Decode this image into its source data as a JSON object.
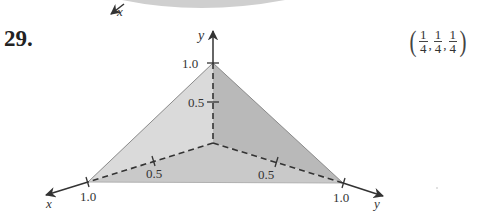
{
  "problem": {
    "number": "29.",
    "answer": {
      "open": "(",
      "close": ")",
      "fractions": [
        {
          "num": "1",
          "den": "4"
        },
        {
          "num": "1",
          "den": "4"
        },
        {
          "num": "1",
          "den": "4"
        }
      ],
      "separator": ","
    }
  },
  "figure": {
    "top_axis_label": "x",
    "axes": {
      "x": {
        "label": "x",
        "ticks": [
          "0.5",
          "1.0"
        ]
      },
      "y_vertical": {
        "label": "y",
        "ticks": [
          "0.5",
          "1.0"
        ]
      },
      "y_right": {
        "label": "y",
        "ticks": [
          "0.5",
          "1.0"
        ]
      }
    },
    "colors": {
      "face_left": "#dadada",
      "face_right": "#b9b9b9",
      "face_bottom": "#c9c9c9",
      "top_shape": "#cfcfcf",
      "line": "#333333"
    }
  }
}
